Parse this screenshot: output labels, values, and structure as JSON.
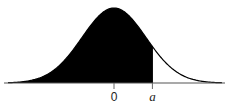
{
  "chart_data": {
    "type": "area",
    "title": "",
    "xlabel": "",
    "ylabel": "",
    "x_ticks": [
      {
        "value": 0,
        "label": "0",
        "italic": false
      },
      {
        "value": 1.2,
        "label": "a",
        "italic": true
      }
    ],
    "distribution": {
      "name": "normal",
      "mean": 0,
      "sd": 1
    },
    "shaded_region": {
      "from": "-inf",
      "to": "a",
      "a_estimate": 1.2
    },
    "xlim": [
      -3.5,
      3.5
    ],
    "grid": false,
    "legend": null,
    "colors": {
      "fill": "#000000",
      "curve": "#000000",
      "axis": "#555555",
      "background": "#ffffff"
    }
  },
  "labels": {
    "tick_zero": "0",
    "tick_a": "a"
  }
}
